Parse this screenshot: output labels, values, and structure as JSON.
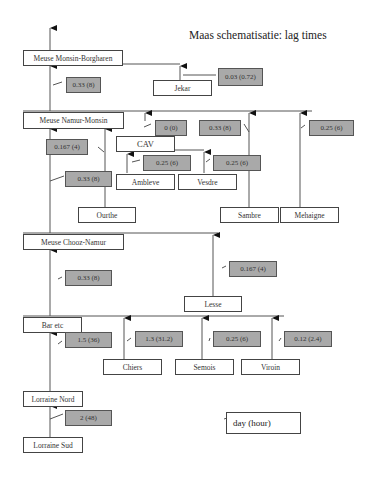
{
  "title": "Maas schematisatie: lag times",
  "nodes": {
    "monsin_borgharen": "Meuse Monsin-Borgharen",
    "jekar": "Jekar",
    "namur_monsin": "Meuse Namur-Monsin",
    "cav": "CAV",
    "ambleve": "Ambleve",
    "vesdre": "Vesdre",
    "ourthe": "Ourthe",
    "sambre": "Sambre",
    "mehaigne": "Mehaigne",
    "chooz_namur": "Meuse Chooz-Namur",
    "lesse": "Lesse",
    "bar_etc": "Bar etc",
    "chiers": "Chiers",
    "semois": "Semois",
    "viroin": "Viroin",
    "lorraine_nord": "Lorraine Nord",
    "lorraine_sud": "Lorraine Sud"
  },
  "lags": {
    "namur_to_monsin_borgharen": "0.33 (8)",
    "jekar": "0.03 (0.72)",
    "cav": "0 (0)",
    "sambre": "0.33 (8)",
    "mehaigne": "0.25 (6)",
    "chooz_to_namur_monsin": "0.167 (4)",
    "ambleve": "0.25 (6)",
    "vesdre": "0.25 (6)",
    "ourthe": "0.33 (8)",
    "bar_to_chooz": "0.33 (8)",
    "lesse": "0.167 (4)",
    "lorraine_nord_to_bar": "1.5 (36)",
    "chiers": "1.3 (31.2)",
    "semois": "0.25 (6)",
    "viroin": "0.12 (2.4)",
    "lorraine_sud_to_nord": "2 (48)"
  },
  "legend": {
    "label": "day (hour)"
  },
  "colors": {
    "lag_box": "#a9a9a9",
    "line": "#444444"
  }
}
